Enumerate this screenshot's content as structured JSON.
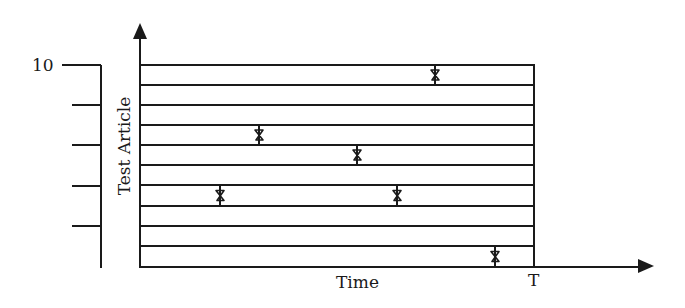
{
  "diagram": {
    "y_axis_label": "Test Article",
    "x_axis_label": "Time",
    "x_end_label": "T",
    "scale_top_label": "10",
    "colors": {
      "ink": "#1a1a1a",
      "background": "#ffffff"
    },
    "strip_count": 10,
    "strip_boundaries_y": [
      65,
      85,
      105,
      125,
      145,
      165,
      185,
      206,
      226,
      246,
      267
    ],
    "box": {
      "x0": 141,
      "x1": 534,
      "y0": 65,
      "y1": 267
    },
    "scale": {
      "line_x": 101,
      "ticks_y": [
        65,
        105,
        145,
        186,
        226
      ],
      "bottom_y": 268
    },
    "events": [
      {
        "strip": 1,
        "x": 435
      },
      {
        "strip": 4,
        "x": 259
      },
      {
        "strip": 5,
        "x": 357
      },
      {
        "strip": 7,
        "x": 220
      },
      {
        "strip": 7,
        "x": 397
      },
      {
        "strip": 10,
        "x": 495
      }
    ]
  }
}
